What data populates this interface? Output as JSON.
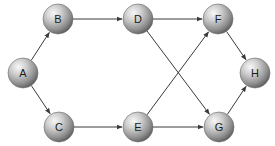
{
  "diagram": {
    "type": "directed-graph",
    "nodes": [
      {
        "id": "A",
        "label": "A",
        "x": 23,
        "y": 73
      },
      {
        "id": "B",
        "label": "B",
        "x": 58,
        "y": 19
      },
      {
        "id": "C",
        "label": "C",
        "x": 59,
        "y": 127
      },
      {
        "id": "D",
        "label": "D",
        "x": 138,
        "y": 19
      },
      {
        "id": "E",
        "label": "E",
        "x": 138,
        "y": 127
      },
      {
        "id": "F",
        "label": "F",
        "x": 218,
        "y": 19
      },
      {
        "id": "G",
        "label": "G",
        "x": 219,
        "y": 127
      },
      {
        "id": "H",
        "label": "H",
        "x": 255,
        "y": 73
      }
    ],
    "edges": [
      {
        "from": "A",
        "to": "B"
      },
      {
        "from": "A",
        "to": "C"
      },
      {
        "from": "B",
        "to": "D"
      },
      {
        "from": "C",
        "to": "E"
      },
      {
        "from": "D",
        "to": "F"
      },
      {
        "from": "D",
        "to": "G"
      },
      {
        "from": "E",
        "to": "F"
      },
      {
        "from": "E",
        "to": "G"
      },
      {
        "from": "F",
        "to": "H"
      },
      {
        "from": "G",
        "to": "H"
      }
    ],
    "node_radius": 15,
    "colors": {
      "edge": "#3a3a3a",
      "node_light": "#f2f2f2",
      "node_mid": "#a8a8a8",
      "node_dark": "#5a5a5a"
    }
  }
}
